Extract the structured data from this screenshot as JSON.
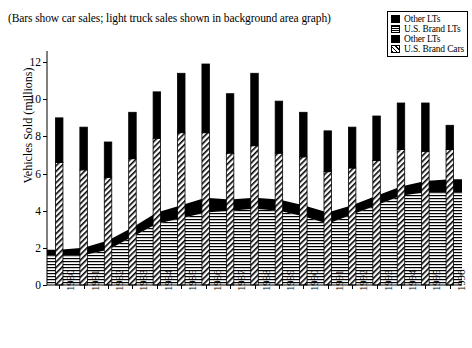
{
  "note": "(Bars show car sales; light truck sales shown in background area graph)",
  "legend": {
    "items": [
      {
        "label": "Other LTs",
        "swatch": "solid-black",
        "color": "#000000"
      },
      {
        "label": "U.S. Brand LTs",
        "swatch": "horizontal-lines",
        "color": "#000000"
      },
      {
        "label": "Other LTs",
        "swatch": "solid-black",
        "color": "#000000"
      },
      {
        "label": "U.S. Brand Cars",
        "swatch": "diagonal-hatch",
        "color": "#000000"
      }
    ]
  },
  "chart_data": {
    "type": "bar",
    "title": "",
    "subtitle": "(Bars show car sales; light truck sales shown in background area graph)",
    "xlabel": "",
    "ylabel": "Vehicles Sold (millions)",
    "ylim": [
      0,
      12.6
    ],
    "yticks": [
      0,
      2,
      4,
      6,
      8,
      10,
      12
    ],
    "ytick_labels": [
      "0",
      "2",
      "4",
      "6",
      "8",
      "10",
      "12"
    ],
    "grid": false,
    "legend_position": "top-right",
    "categories": [
      "1980",
      "1981",
      "1982",
      "1983",
      "1984",
      "1985",
      "1986",
      "1987",
      "1988",
      "1989",
      "1990",
      "1991",
      "1992",
      "1993",
      "1994",
      "1995",
      "1996"
    ],
    "series": [
      {
        "name": "U.S. Brand Cars",
        "kind": "bar-stack-bottom",
        "pattern": "diagonal-hatch",
        "values": [
          6.6,
          6.2,
          5.8,
          6.8,
          7.9,
          8.2,
          8.2,
          7.1,
          7.5,
          7.1,
          6.9,
          6.1,
          6.3,
          6.7,
          7.3,
          7.2,
          7.3
        ]
      },
      {
        "name": "Other Cars",
        "kind": "bar-stack-top",
        "pattern": "solid-black",
        "values": [
          2.4,
          2.3,
          1.9,
          2.5,
          2.5,
          3.2,
          3.7,
          3.2,
          3.9,
          2.8,
          2.4,
          2.2,
          2.2,
          2.4,
          2.5,
          2.6,
          1.3
        ]
      },
      {
        "name": "U.S. Brand LTs",
        "kind": "area-bottom",
        "pattern": "horizontal-lines",
        "values": [
          1.6,
          1.6,
          1.9,
          2.6,
          3.3,
          3.6,
          3.9,
          4.0,
          4.1,
          4.0,
          3.7,
          3.3,
          3.8,
          4.3,
          4.8,
          5.0,
          5.0
        ]
      },
      {
        "name": "Other LTs",
        "kind": "area-top",
        "pattern": "solid-black",
        "values": [
          0.3,
          0.4,
          0.5,
          0.5,
          0.6,
          0.7,
          0.8,
          0.6,
          0.6,
          0.6,
          0.6,
          0.6,
          0.5,
          0.5,
          0.5,
          0.6,
          0.7
        ]
      }
    ],
    "totals_cars": [
      9.0,
      8.5,
      7.7,
      9.3,
      10.4,
      11.4,
      11.9,
      10.3,
      11.4,
      9.9,
      9.3,
      8.3,
      8.5,
      9.1,
      9.8,
      9.8,
      8.6
    ],
    "totals_light_trucks": [
      1.9,
      2.0,
      2.4,
      3.1,
      3.9,
      4.3,
      4.7,
      4.6,
      4.7,
      4.6,
      4.3,
      3.9,
      4.3,
      4.8,
      5.3,
      5.6,
      5.7
    ]
  }
}
